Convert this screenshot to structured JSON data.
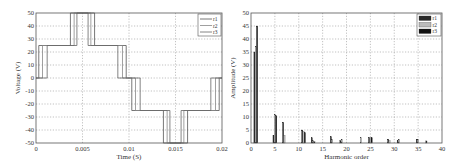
{
  "chart_data": [
    {
      "type": "line",
      "title": "",
      "xlabel": "Time (S)",
      "ylabel": "Voltage (V)",
      "xlim": [
        0,
        0.02
      ],
      "ylim": [
        -50,
        50
      ],
      "xticks": [
        "0",
        "0.005",
        "0.01",
        "0.015",
        "0.02"
      ],
      "xtick_values": [
        0,
        0.005,
        0.01,
        0.015,
        0.02
      ],
      "yticks": [
        "-50",
        "-40",
        "-30",
        "-20",
        "-10",
        "0",
        "10",
        "20",
        "30",
        "40",
        "50"
      ],
      "ytick_values": [
        -50,
        -40,
        -30,
        -20,
        -10,
        0,
        10,
        20,
        30,
        40,
        50
      ],
      "grid": true,
      "legend_position": "upper right",
      "series": [
        {
          "name": "r1",
          "color": "#555555",
          "x": [
            0,
            0.0003,
            0.0003,
            0.0037,
            0.0037,
            0.0063,
            0.0063,
            0.0097,
            0.0097,
            0.0103,
            0.0103,
            0.0137,
            0.0137,
            0.0163,
            0.0163,
            0.0197,
            0.0197,
            0.02
          ],
          "y": [
            0,
            0,
            25,
            25,
            50,
            50,
            25,
            25,
            0,
            0,
            -25,
            -25,
            -50,
            -50,
            -25,
            -25,
            0,
            0
          ]
        },
        {
          "name": "r2",
          "color": "#888888",
          "x": [
            0,
            0.0007,
            0.0007,
            0.0041,
            0.0041,
            0.0059,
            0.0059,
            0.0093,
            0.0093,
            0.0107,
            0.0107,
            0.0141,
            0.0141,
            0.0159,
            0.0159,
            0.0193,
            0.0193,
            0.02
          ],
          "y": [
            0,
            0,
            25,
            25,
            50,
            50,
            25,
            25,
            0,
            0,
            -25,
            -25,
            -50,
            -50,
            -25,
            -25,
            0,
            0
          ]
        },
        {
          "name": "r3",
          "color": "#666666",
          "x": [
            0,
            0.0012,
            0.0012,
            0.0044,
            0.0044,
            0.0056,
            0.0056,
            0.0088,
            0.0088,
            0.0112,
            0.0112,
            0.0144,
            0.0144,
            0.0156,
            0.0156,
            0.0188,
            0.0188,
            0.02
          ],
          "y": [
            0,
            0,
            25,
            25,
            50,
            50,
            25,
            25,
            0,
            0,
            -25,
            -25,
            -50,
            -50,
            -25,
            -25,
            0,
            0
          ]
        }
      ]
    },
    {
      "type": "bar",
      "title": "",
      "xlabel": "Harmonic order",
      "ylabel": "Amplitude (V)",
      "xlim": [
        0,
        40
      ],
      "ylim": [
        0,
        50
      ],
      "xticks": [
        "0",
        "5",
        "10",
        "15",
        "20",
        "25",
        "30",
        "35",
        "40"
      ],
      "xtick_values": [
        0,
        5,
        10,
        15,
        20,
        25,
        30,
        35,
        40
      ],
      "yticks": [
        "0",
        "5",
        "10",
        "15",
        "20",
        "25",
        "30",
        "35",
        "40",
        "45",
        "50"
      ],
      "ytick_values": [
        0,
        5,
        10,
        15,
        20,
        25,
        30,
        35,
        40,
        45,
        50
      ],
      "grid": true,
      "legend_position": "upper right",
      "categories": [
        1,
        5,
        7,
        11,
        13,
        17,
        19,
        23,
        25,
        29,
        31,
        35,
        37
      ],
      "series": [
        {
          "name": "r1",
          "color": "#2a2a2a",
          "values": [
            35,
            3,
            8,
            5,
            2,
            2.5,
            1,
            0,
            2,
            1.5,
            1,
            1.5,
            0.8
          ]
        },
        {
          "name": "r2",
          "color": "#bbbbbb",
          "values": [
            37,
            11,
            3,
            4.5,
            1,
            1.5,
            1.5,
            2,
            2,
            1,
            1.5,
            1.5,
            0
          ]
        },
        {
          "name": "r3",
          "color": "#111111",
          "values": [
            45,
            10.5,
            0,
            4,
            0.5,
            0,
            0,
            0,
            2,
            0,
            0,
            0,
            0
          ]
        }
      ]
    }
  ]
}
